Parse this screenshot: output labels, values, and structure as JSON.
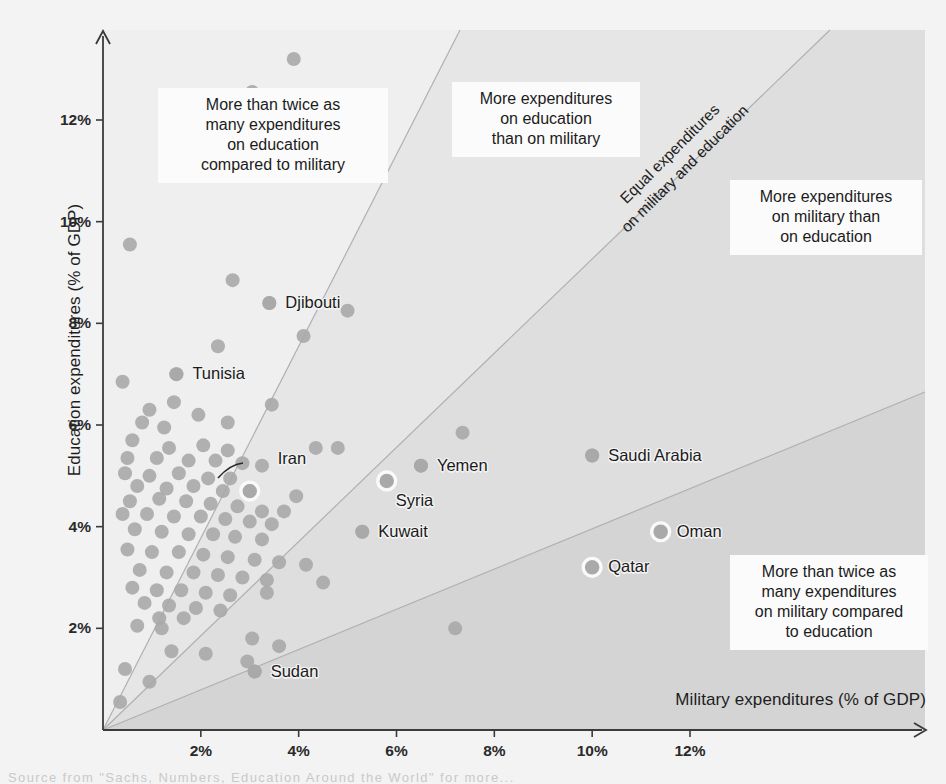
{
  "chart_data": {
    "type": "scatter",
    "title": "",
    "xlabel": "Military expenditures (% of GDP)",
    "ylabel": "Education expenditures (% of GDP)",
    "xlim": [
      0,
      14.2
    ],
    "ylim": [
      0,
      13.6
    ],
    "grid": false,
    "legend": "none",
    "xticks": [
      "2%",
      "4%",
      "6%",
      "8%",
      "10%",
      "12%"
    ],
    "xtick_values": [
      2,
      4,
      6,
      8,
      10,
      12
    ],
    "yticks": [
      "2%",
      "4%",
      "6%",
      "8%",
      "10%",
      "12%"
    ],
    "ytick_values": [
      2,
      4,
      6,
      8,
      10,
      12
    ],
    "reference_lines": [
      {
        "name": "equal-expenditures",
        "slope": 1,
        "label": "Equal expenditures\non military and education"
      },
      {
        "name": "twice-education",
        "slope": 2,
        "label": "More than twice as many expenditures on education compared to military"
      },
      {
        "name": "twice-military",
        "slope": 0.5,
        "label": "More than twice as many expenditures on military compared to education"
      }
    ],
    "labeled_points": [
      {
        "name": "Tunisia",
        "x": 1.5,
        "y": 7.0,
        "highlighted": false,
        "label_side": "right"
      },
      {
        "name": "Djibouti",
        "x": 3.4,
        "y": 8.4,
        "highlighted": false,
        "label_side": "right"
      },
      {
        "name": "Iran",
        "x": 3.0,
        "y": 4.7,
        "highlighted": true,
        "label_side": "callout"
      },
      {
        "name": "Yemen",
        "x": 6.5,
        "y": 5.2,
        "highlighted": false,
        "label_side": "right"
      },
      {
        "name": "Syria",
        "x": 5.8,
        "y": 4.9,
        "highlighted": true,
        "label_side": "below"
      },
      {
        "name": "Saudi Arabia",
        "x": 10.0,
        "y": 5.4,
        "highlighted": false,
        "label_side": "right"
      },
      {
        "name": "Kuwait",
        "x": 5.3,
        "y": 3.9,
        "highlighted": false,
        "label_side": "right"
      },
      {
        "name": "Oman",
        "x": 11.4,
        "y": 3.9,
        "highlighted": true,
        "label_side": "right"
      },
      {
        "name": "Qatar",
        "x": 10.0,
        "y": 3.2,
        "highlighted": true,
        "label_side": "right"
      },
      {
        "name": "Sudan",
        "x": 3.1,
        "y": 1.15,
        "highlighted": false,
        "label_side": "right"
      }
    ],
    "points": [
      {
        "x": 3.9,
        "y": 13.2
      },
      {
        "x": 3.05,
        "y": 12.55
      },
      {
        "x": 4.55,
        "y": 11.2
      },
      {
        "x": 0.55,
        "y": 9.55
      },
      {
        "x": 2.65,
        "y": 8.85
      },
      {
        "x": 3.4,
        "y": 8.4
      },
      {
        "x": 5.0,
        "y": 8.25
      },
      {
        "x": 4.1,
        "y": 7.75
      },
      {
        "x": 2.35,
        "y": 7.55
      },
      {
        "x": 0.4,
        "y": 6.85
      },
      {
        "x": 1.5,
        "y": 7.0
      },
      {
        "x": 1.45,
        "y": 6.45
      },
      {
        "x": 0.95,
        "y": 6.3
      },
      {
        "x": 3.45,
        "y": 6.4
      },
      {
        "x": 0.8,
        "y": 6.05
      },
      {
        "x": 1.95,
        "y": 6.2
      },
      {
        "x": 2.55,
        "y": 6.05
      },
      {
        "x": 7.35,
        "y": 5.85
      },
      {
        "x": 1.25,
        "y": 5.95
      },
      {
        "x": 0.6,
        "y": 5.7
      },
      {
        "x": 1.35,
        "y": 5.55
      },
      {
        "x": 2.05,
        "y": 5.6
      },
      {
        "x": 2.55,
        "y": 5.5
      },
      {
        "x": 4.35,
        "y": 5.55
      },
      {
        "x": 4.8,
        "y": 5.55
      },
      {
        "x": 0.5,
        "y": 5.35
      },
      {
        "x": 1.1,
        "y": 5.35
      },
      {
        "x": 1.75,
        "y": 5.3
      },
      {
        "x": 2.3,
        "y": 5.3
      },
      {
        "x": 2.85,
        "y": 5.25
      },
      {
        "x": 3.25,
        "y": 5.2
      },
      {
        "x": 10.0,
        "y": 5.4
      },
      {
        "x": 0.45,
        "y": 5.05
      },
      {
        "x": 0.95,
        "y": 5.0
      },
      {
        "x": 1.55,
        "y": 5.05
      },
      {
        "x": 2.15,
        "y": 4.95
      },
      {
        "x": 2.6,
        "y": 4.95
      },
      {
        "x": 6.5,
        "y": 5.2
      },
      {
        "x": 0.7,
        "y": 4.8
      },
      {
        "x": 1.3,
        "y": 4.75
      },
      {
        "x": 1.85,
        "y": 4.8
      },
      {
        "x": 2.45,
        "y": 4.7
      },
      {
        "x": 3.0,
        "y": 4.7
      },
      {
        "x": 3.95,
        "y": 4.6
      },
      {
        "x": 5.8,
        "y": 4.9
      },
      {
        "x": 0.55,
        "y": 4.5
      },
      {
        "x": 1.15,
        "y": 4.55
      },
      {
        "x": 1.7,
        "y": 4.5
      },
      {
        "x": 2.2,
        "y": 4.45
      },
      {
        "x": 2.75,
        "y": 4.4
      },
      {
        "x": 3.25,
        "y": 4.3
      },
      {
        "x": 3.7,
        "y": 4.3
      },
      {
        "x": 0.4,
        "y": 4.25
      },
      {
        "x": 0.9,
        "y": 4.25
      },
      {
        "x": 1.45,
        "y": 4.2
      },
      {
        "x": 2.0,
        "y": 4.2
      },
      {
        "x": 2.5,
        "y": 4.15
      },
      {
        "x": 3.0,
        "y": 4.1
      },
      {
        "x": 3.45,
        "y": 4.05
      },
      {
        "x": 5.3,
        "y": 3.9
      },
      {
        "x": 0.65,
        "y": 3.95
      },
      {
        "x": 1.2,
        "y": 3.9
      },
      {
        "x": 1.75,
        "y": 3.85
      },
      {
        "x": 2.25,
        "y": 3.85
      },
      {
        "x": 2.7,
        "y": 3.8
      },
      {
        "x": 3.25,
        "y": 3.75
      },
      {
        "x": 11.4,
        "y": 3.9
      },
      {
        "x": 0.5,
        "y": 3.55
      },
      {
        "x": 1.0,
        "y": 3.5
      },
      {
        "x": 1.55,
        "y": 3.5
      },
      {
        "x": 2.05,
        "y": 3.45
      },
      {
        "x": 2.55,
        "y": 3.4
      },
      {
        "x": 3.1,
        "y": 3.35
      },
      {
        "x": 3.6,
        "y": 3.3
      },
      {
        "x": 4.15,
        "y": 3.25
      },
      {
        "x": 10.0,
        "y": 3.2
      },
      {
        "x": 0.75,
        "y": 3.15
      },
      {
        "x": 1.3,
        "y": 3.1
      },
      {
        "x": 1.85,
        "y": 3.1
      },
      {
        "x": 2.35,
        "y": 3.05
      },
      {
        "x": 2.85,
        "y": 3.0
      },
      {
        "x": 3.35,
        "y": 2.95
      },
      {
        "x": 4.5,
        "y": 2.9
      },
      {
        "x": 0.6,
        "y": 2.8
      },
      {
        "x": 1.1,
        "y": 2.75
      },
      {
        "x": 1.6,
        "y": 2.75
      },
      {
        "x": 2.1,
        "y": 2.7
      },
      {
        "x": 2.6,
        "y": 2.65
      },
      {
        "x": 3.35,
        "y": 2.7
      },
      {
        "x": 0.85,
        "y": 2.5
      },
      {
        "x": 1.35,
        "y": 2.45
      },
      {
        "x": 1.9,
        "y": 2.4
      },
      {
        "x": 2.4,
        "y": 2.35
      },
      {
        "x": 1.15,
        "y": 2.2
      },
      {
        "x": 1.65,
        "y": 2.2
      },
      {
        "x": 0.7,
        "y": 2.05
      },
      {
        "x": 1.2,
        "y": 2.0
      },
      {
        "x": 7.2,
        "y": 2.0
      },
      {
        "x": 3.05,
        "y": 1.8
      },
      {
        "x": 3.6,
        "y": 1.65
      },
      {
        "x": 1.4,
        "y": 1.55
      },
      {
        "x": 2.1,
        "y": 1.5
      },
      {
        "x": 2.95,
        "y": 1.35
      },
      {
        "x": 3.1,
        "y": 1.15
      },
      {
        "x": 0.45,
        "y": 1.2
      },
      {
        "x": 0.95,
        "y": 0.95
      },
      {
        "x": 0.35,
        "y": 0.55
      }
    ]
  },
  "axes": {
    "y_title": "Education expenditures (% of GDP)",
    "x_title": "Military expenditures (% of GDP)",
    "y_ticks": [
      {
        "label": "12%",
        "value": 12
      },
      {
        "label": "10%",
        "value": 10
      },
      {
        "label": "8%",
        "value": 8
      },
      {
        "label": "6%",
        "value": 6
      },
      {
        "label": "4%",
        "value": 4
      },
      {
        "label": "2%",
        "value": 2
      }
    ],
    "x_ticks": [
      {
        "label": "2%",
        "value": 2
      },
      {
        "label": "4%",
        "value": 4
      },
      {
        "label": "6%",
        "value": 6
      },
      {
        "label": "8%",
        "value": 8
      },
      {
        "label": "10%",
        "value": 10
      },
      {
        "label": "12%",
        "value": 12
      }
    ]
  },
  "annotations": {
    "education_twice": "More than twice as\nmany expenditures\non education\ncompared to military",
    "education_more": "More expenditures\non education\nthan on military",
    "military_more": "More expenditures\non military than\non education",
    "military_twice": "More than twice as\nmany expenditures\non military compared\nto education",
    "equal_line": "Equal expenditures\non military and education"
  },
  "point_labels": {
    "tunisia": "Tunisia",
    "djibouti": "Djibouti",
    "iran": "Iran",
    "yemen": "Yemen",
    "syria": "Syria",
    "saudi_arabia": "Saudi Arabia",
    "kuwait": "Kuwait",
    "oman": "Oman",
    "qatar": "Qatar",
    "sudan": "Sudan"
  },
  "source_note": "Source from \"Sachs, Numbers, Education Around the World\" for more...",
  "colors": {
    "background": "#f3f3f3",
    "band_light": "#ebebeb",
    "band_mid": "#e0e0e0",
    "band_dark": "#d5d5d5",
    "point": "#a8a8a8",
    "point_highlight_ring": "#fafafa",
    "axis": "#3a3a3a",
    "text": "#1b1b1b",
    "annot_bg": "#fbfbfb"
  }
}
